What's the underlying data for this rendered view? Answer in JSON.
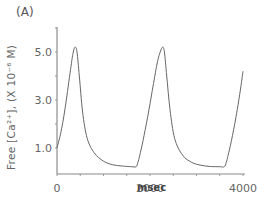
{
  "panel_label": "(A)",
  "chart_data": {
    "type": "line",
    "title": "",
    "panel": "(A)",
    "xlabel": "msec",
    "ylabel": "Free [Ca2+], (X 10^-6 M)",
    "ylabel_display": "Free [Ca²⁺], (X 10⁻⁶ M)",
    "xlim": [
      0,
      4000
    ],
    "ylim": [
      0,
      6.0
    ],
    "xticks": [
      0,
      2000,
      4000
    ],
    "xtick_labels": [
      "0",
      "2000",
      "4000"
    ],
    "yticks": [
      1.0,
      3.0,
      5.0
    ],
    "ytick_labels": [
      "1.0",
      "3.0",
      "5.0"
    ],
    "grid": false,
    "legend": null,
    "series": [
      {
        "name": "Free Ca2+",
        "x": [
          0,
          100,
          200,
          300,
          350,
          390,
          430,
          480,
          550,
          650,
          800,
          1000,
          1200,
          1400,
          1600,
          1700,
          1740,
          1780,
          1850,
          1950,
          2050,
          2150,
          2220,
          2270,
          2310,
          2360,
          2430,
          2530,
          2700,
          2900,
          3100,
          3300,
          3500,
          3600,
          3640,
          3680,
          3750,
          3850,
          3950,
          4000
        ],
        "values": [
          1.0,
          1.8,
          3.0,
          4.4,
          5.0,
          5.2,
          5.0,
          4.0,
          2.5,
          1.4,
          0.8,
          0.45,
          0.3,
          0.25,
          0.22,
          0.22,
          0.4,
          0.7,
          1.3,
          2.3,
          3.4,
          4.5,
          5.0,
          5.2,
          5.0,
          4.0,
          2.6,
          1.4,
          0.7,
          0.4,
          0.28,
          0.23,
          0.22,
          0.22,
          0.4,
          0.7,
          1.3,
          2.3,
          3.5,
          4.2
        ]
      }
    ]
  }
}
